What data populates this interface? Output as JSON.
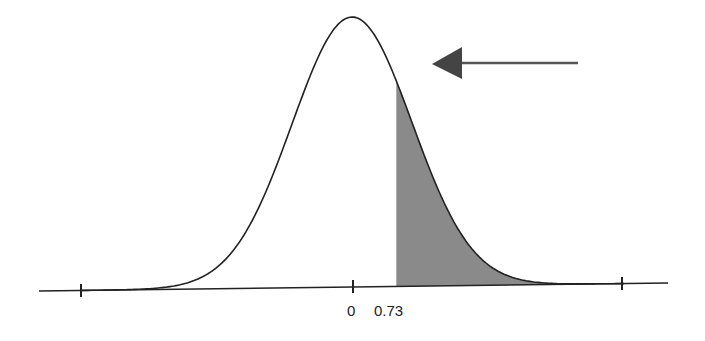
{
  "chart_data": {
    "type": "area",
    "title": "",
    "distribution": "normal",
    "mean": 0,
    "sd": 1,
    "shaded_region": {
      "from": 0.73,
      "to": "infinity",
      "color": "#8a8a8a"
    },
    "tick_labels": [
      "0",
      "0.73"
    ],
    "unlabeled_ticks": 2,
    "annotation": {
      "type": "arrow",
      "direction": "left",
      "points_to": "shaded right tail",
      "color": "#555555"
    },
    "xlabel": "",
    "ylabel": "",
    "grid": false,
    "legend": false
  },
  "labels": {
    "zero": "0",
    "z": "0.73"
  },
  "colors": {
    "curve": "#222222",
    "shade": "#8a8a8a",
    "arrow": "#555555",
    "axis": "#222222"
  }
}
